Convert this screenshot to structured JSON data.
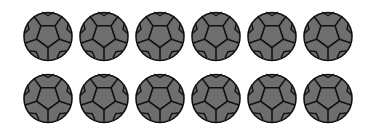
{
  "figure": {
    "rows": 2,
    "columns": 6,
    "item": "soccer-ball-icon",
    "colors": {
      "background": "#ffffff",
      "fill": "#6e6e6e",
      "stroke": "#111111"
    },
    "row_1_count": 6,
    "row_2_count": 6
  }
}
